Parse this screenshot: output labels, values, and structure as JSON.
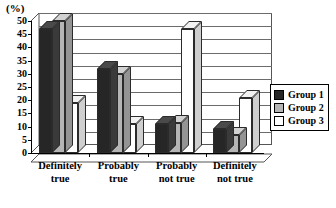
{
  "chart_data": {
    "type": "bar",
    "title": "",
    "subtitle": "",
    "unit_label": "(%)",
    "xlabel": "",
    "ylabel": "",
    "ylim": [
      0,
      50
    ],
    "ytick_step": 5,
    "yticks": [
      0,
      5,
      10,
      15,
      20,
      25,
      30,
      35,
      40,
      45,
      50
    ],
    "ytick_labels": [
      "0",
      "5",
      "10",
      "15",
      "20",
      "25",
      "30",
      "35",
      "40",
      "45",
      "50"
    ],
    "grid": true,
    "grid_axis": "y",
    "legend_position": "right",
    "style": "3d-grouped-columns",
    "categories": [
      "Definitely\ntrue",
      "Probably\ntrue",
      "Probably\nnot true",
      "Definitely\nnot true"
    ],
    "category_labels_flat": [
      "Definitely true",
      "Probably true",
      "Probably not true",
      "Definitely not true"
    ],
    "series": [
      {
        "name": "Group 1",
        "color": "#262626",
        "values": [
          47,
          32,
          11,
          9
        ]
      },
      {
        "name": "Group 2",
        "color": "#b5b5b5",
        "values": [
          50,
          30,
          11.5,
          7
        ]
      },
      {
        "name": "Group 3",
        "color": "#ffffff",
        "values": [
          19,
          11,
          47,
          21
        ]
      }
    ]
  },
  "legend": {
    "items": [
      {
        "label": "Group 1"
      },
      {
        "label": "Group 2"
      },
      {
        "label": "Group 3"
      }
    ]
  }
}
